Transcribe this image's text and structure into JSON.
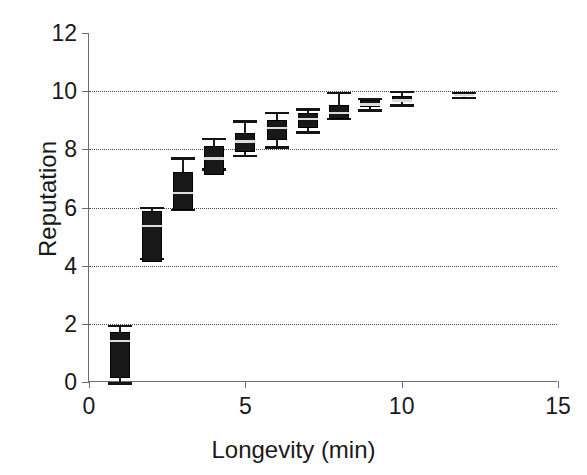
{
  "chart_data": {
    "type": "box",
    "title": "",
    "xlabel": "Longevity (min)",
    "ylabel": "Reputation",
    "xlim": [
      0,
      15
    ],
    "ylim": [
      0,
      12
    ],
    "xticks": [
      0,
      5,
      10,
      15
    ],
    "xtick_labels": [
      "0",
      "5",
      "10",
      "15"
    ],
    "yticks": [
      0,
      2,
      4,
      6,
      8,
      10,
      12
    ],
    "ytick_labels": [
      "0",
      "2",
      "4",
      "6",
      "8",
      "10",
      "12"
    ],
    "grid": "horizontal-dotted",
    "legend": "none",
    "series_color": "#181818",
    "boxes": [
      {
        "x": 1,
        "whisker_low": 0.0,
        "q1": 0.15,
        "median": 1.45,
        "q3": 1.72,
        "whisker_high": 1.97
      },
      {
        "x": 2,
        "whisker_low": 4.28,
        "q1": 4.12,
        "median": 5.4,
        "q3": 5.88,
        "whisker_high": 6.02
      },
      {
        "x": 3,
        "whisker_low": 5.95,
        "q1": 5.91,
        "median": 6.55,
        "q3": 7.22,
        "whisker_high": 7.72
      },
      {
        "x": 4,
        "whisker_low": 7.35,
        "q1": 7.11,
        "median": 7.72,
        "q3": 8.11,
        "whisker_high": 8.4
      },
      {
        "x": 5,
        "whisker_low": 7.82,
        "q1": 7.9,
        "median": 8.32,
        "q3": 8.56,
        "whisker_high": 9.0
      },
      {
        "x": 6,
        "whisker_low": 8.1,
        "q1": 8.32,
        "median": 8.78,
        "q3": 9.0,
        "whisker_high": 9.3
      },
      {
        "x": 7,
        "whisker_low": 8.62,
        "q1": 8.73,
        "median": 9.08,
        "q3": 9.24,
        "whisker_high": 9.42
      },
      {
        "x": 8,
        "whisker_low": 9.08,
        "q1": 9.04,
        "median": 9.3,
        "q3": 9.52,
        "whisker_high": 9.98
      },
      {
        "x": 9,
        "whisker_low": 9.38,
        "q1": 9.45,
        "median": 9.58,
        "q3": 9.7,
        "whisker_high": 9.78
      },
      {
        "x": 10,
        "whisker_low": 9.55,
        "q1": 9.62,
        "median": 9.72,
        "q3": 9.82,
        "whisker_high": 10.02
      },
      {
        "x": 12,
        "whisker_low": 9.8,
        "q1": 9.84,
        "median": 9.9,
        "q3": 9.96,
        "whisker_high": 9.98
      }
    ]
  }
}
